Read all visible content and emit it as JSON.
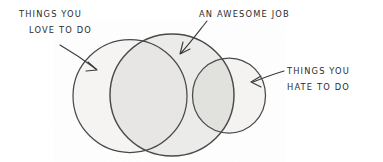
{
  "diagram": {
    "kind": "hand-drawn-venn-diagram",
    "medium": "pencil sketch on white paper",
    "background_color": "#ffffff",
    "stroke_color": "#4a4a4a",
    "text_color": "#2b2b2b",
    "labels": {
      "love": {
        "line1": "THINGS YOU",
        "line2": "LOVE TO DO"
      },
      "awesome": {
        "line1": "AN AWESOME JOB"
      },
      "hate": {
        "line1": "THINGS YOU",
        "line2": "HATE TO DO"
      }
    },
    "circles": [
      {
        "name": "things-you-love-to-do",
        "cx": 130,
        "cy": 96,
        "r": 57,
        "fill": "#f6f5f3"
      },
      {
        "name": "an-awesome-job",
        "cx": 172,
        "cy": 95,
        "r": 62,
        "fill": "#ececeb"
      },
      {
        "name": "things-you-hate-to-do",
        "cx": 229,
        "cy": 95,
        "r": 37,
        "fill": "#f6f5f3"
      }
    ],
    "arrows": [
      {
        "name": "arrow-to-love-circle",
        "from_x": 60,
        "from_y": 46,
        "to_x": 97,
        "to_y": 70
      },
      {
        "name": "arrow-to-awesome-circle",
        "from_x": 206,
        "from_y": 22,
        "to_x": 181,
        "to_y": 54
      },
      {
        "name": "arrow-to-hate-circle",
        "from_x": 283,
        "from_y": 71,
        "to_x": 252,
        "to_y": 82
      }
    ]
  }
}
